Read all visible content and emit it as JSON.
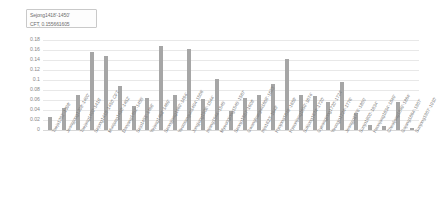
{
  "tooltip": {
    "series_line": "Sejong1418'-1450'",
    "value_line": "CFT, 0.155661605"
  },
  "chart_data": {
    "type": "bar",
    "title": "",
    "subtitle": "",
    "xlabel": "",
    "ylabel": "",
    "ylim": [
      0,
      0.18
    ],
    "grid": true,
    "legend": "none",
    "ytick_labels": [
      "0.18",
      "0.16",
      "0.14",
      "0.12",
      "0.1",
      "0.08",
      "0.06",
      "0.04",
      "0.02",
      "0"
    ],
    "ytick_values": [
      0.18,
      0.16,
      0.14,
      0.12,
      0.1,
      0.08,
      0.06,
      0.04,
      0.02,
      0
    ],
    "series_name": "CFT",
    "bar_color": "#a6a6a6",
    "categories": [
      "Taejo1392'-1398'",
      "Jeongjong1398'-1400'",
      "Taejong1400'-1418'",
      "Sejong1418'-1450' CFT",
      "Munjong1450'-1452'",
      "Danjong1452'-1455'",
      "Sejo1455'-1468'",
      "Yejong1468'-1469'",
      "Seongjong1469'-1494'",
      "Yeonsangun1494'-1506'",
      "Jungjong1506'-1544'",
      "Injong1544'-1545'",
      "Myeongjong1545'-1567'",
      "Seonjo1567'-1608'",
      "Gwanghaegun1608'-1623'",
      "Injo1623'-1649'",
      "Hyojong1649'-1659'",
      "Hyeonjong1659'-1674'",
      "Sukjong1674'-1720'",
      "Gyeongjong1720'-1724'",
      "Yeongjo1724'-1776'",
      "Jeongjo1776'-1800'",
      "Sunjo1800'-1834'",
      "Heonjong1834'-1849'",
      "Cheoljong1849'-1864'",
      "Gojong1864'-1907'",
      "Sunjong1907'-1910'"
    ],
    "values": [
      0.027,
      0.044,
      0.07,
      0.156,
      0.148,
      0.088,
      0.049,
      0.065,
      0.168,
      0.07,
      0.162,
      0.063,
      0.103,
      0.038,
      0.064,
      0.07,
      0.092,
      0.142,
      0.07,
      0.069,
      0.057,
      0.096,
      0.035,
      0.01,
      0.008,
      0.057,
      0.005
    ],
    "highlighted_index": 3,
    "highlighted_value": 0.155661605
  }
}
